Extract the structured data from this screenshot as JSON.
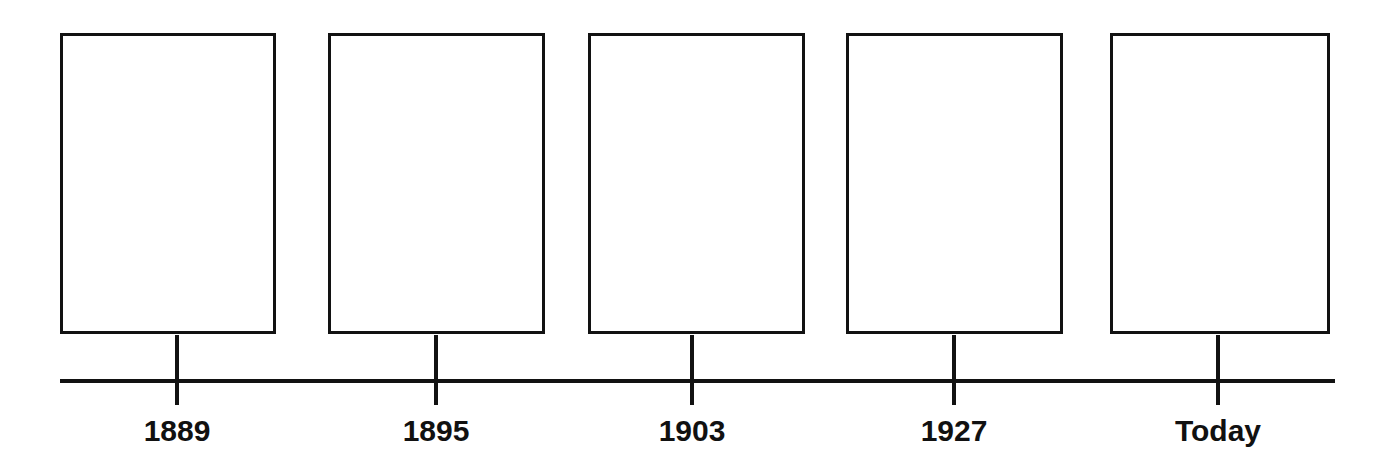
{
  "diagram": {
    "type": "timeline",
    "title": "",
    "background_color": "#ffffff",
    "stroke_color": "#121212",
    "label_color": "#111111",
    "axis": {
      "label": "timeline-axis",
      "start_x": 60,
      "end_x": 1335,
      "y": 381,
      "thickness": 4
    },
    "box_top": 33,
    "box_bottom": 334,
    "tick_bottom": 405,
    "label_y": 414,
    "entries": [
      {
        "label": "1889",
        "box_x": 60,
        "box_width": 216,
        "tick_x": 177,
        "content": ""
      },
      {
        "label": "1895",
        "box_x": 328,
        "box_width": 217,
        "tick_x": 436,
        "content": ""
      },
      {
        "label": "1903",
        "box_x": 588,
        "box_width": 217,
        "tick_x": 692,
        "content": ""
      },
      {
        "label": "1927",
        "box_x": 846,
        "box_width": 217,
        "tick_x": 954,
        "content": ""
      },
      {
        "label": "Today",
        "box_x": 1110,
        "box_width": 220,
        "tick_x": 1218,
        "content": ""
      }
    ]
  }
}
